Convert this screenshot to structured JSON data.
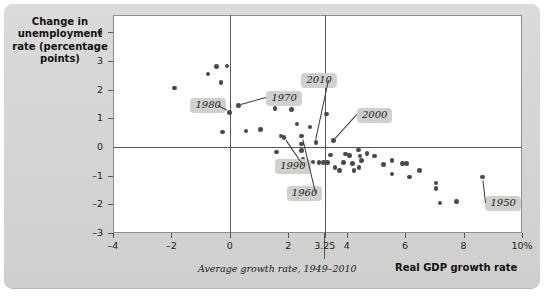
{
  "figure": {
    "y_axis_title": "Change in unemployment rate (percentage points)",
    "x_axis_title": "Real GDP growth rate",
    "annotation_note": "Average growth rate, 1949–2010"
  },
  "chart_data": {
    "type": "scatter",
    "title": "",
    "subtitle": "",
    "xlabel": "Real GDP growth rate",
    "ylabel": "Change in unemployment rate (percentage points)",
    "xlim": [
      -4,
      10
    ],
    "ylim": [
      -3,
      4.6
    ],
    "grid": false,
    "legend": "none",
    "x_ticks": [
      "-4",
      "-2",
      "0",
      "2",
      "3.25",
      "4",
      "6",
      "8",
      "10%"
    ],
    "x_tick_values": [
      -4,
      -2,
      0,
      2,
      3.25,
      4,
      6,
      8,
      10
    ],
    "y_ticks": [
      "4",
      "3",
      "2",
      "1",
      "0",
      "-1",
      "-2",
      "-3"
    ],
    "y_tick_values": [
      4,
      3,
      2,
      1,
      0,
      -1,
      -2,
      -3
    ],
    "reference_lines": [
      {
        "name": "zero-unemployment-change",
        "orientation": "horizontal",
        "value": 0
      },
      {
        "name": "zero-growth",
        "orientation": "vertical",
        "value": 0
      },
      {
        "name": "average-growth-rate",
        "orientation": "vertical",
        "value": 3.25,
        "label": "Average growth rate, 1949–2010"
      }
    ],
    "annotations": [
      {
        "label": "1980",
        "x": 0.0,
        "y": 1.25,
        "box_x": -1.35,
        "box_y": 1.45
      },
      {
        "label": "1970",
        "x": 0.3,
        "y": 1.45,
        "box_x": 1.25,
        "box_y": 1.72
      },
      {
        "label": "2010",
        "x": 2.95,
        "y": 0.16,
        "box_x": 2.45,
        "box_y": 2.33
      },
      {
        "label": "2000",
        "x": 3.55,
        "y": 0.22,
        "box_x": 4.35,
        "box_y": 1.12
      },
      {
        "label": "1990",
        "x": 1.85,
        "y": 0.3,
        "box_x": 1.55,
        "box_y": -0.68
      },
      {
        "label": "1960",
        "x": 2.45,
        "y": 0.35,
        "box_x": 1.95,
        "box_y": -1.62
      },
      {
        "label": "1950",
        "x": 8.65,
        "y": -1.05,
        "box_x": 8.75,
        "box_y": -1.95
      }
    ],
    "points": [
      {
        "x": -1.9,
        "y": 2.05
      },
      {
        "x": -0.75,
        "y": 2.55
      },
      {
        "x": -0.45,
        "y": 2.8
      },
      {
        "x": -0.3,
        "y": 2.25
      },
      {
        "x": -0.1,
        "y": 2.82
      },
      {
        "x": -0.02,
        "y": 1.2
      },
      {
        "x": -0.25,
        "y": 0.52
      },
      {
        "x": 0.3,
        "y": 1.45
      },
      {
        "x": 0.55,
        "y": 0.55
      },
      {
        "x": 1.05,
        "y": 0.6
      },
      {
        "x": 1.55,
        "y": 1.35
      },
      {
        "x": 1.75,
        "y": 0.38
      },
      {
        "x": 1.85,
        "y": 0.32
      },
      {
        "x": 1.6,
        "y": -0.18
      },
      {
        "x": 2.1,
        "y": 1.3
      },
      {
        "x": 2.3,
        "y": 0.8
      },
      {
        "x": 2.45,
        "y": 0.38
      },
      {
        "x": 2.45,
        "y": 0.1
      },
      {
        "x": 2.45,
        "y": -0.12
      },
      {
        "x": 2.5,
        "y": -0.42
      },
      {
        "x": 2.75,
        "y": 0.7
      },
      {
        "x": 2.95,
        "y": 0.16
      },
      {
        "x": 2.6,
        "y": -0.52
      },
      {
        "x": 2.85,
        "y": -0.52
      },
      {
        "x": 3.05,
        "y": -0.55
      },
      {
        "x": 3.2,
        "y": -0.55
      },
      {
        "x": 3.35,
        "y": -0.55
      },
      {
        "x": 3.3,
        "y": 1.15
      },
      {
        "x": 3.55,
        "y": 0.22
      },
      {
        "x": 3.45,
        "y": -0.28
      },
      {
        "x": 3.6,
        "y": -0.72
      },
      {
        "x": 3.75,
        "y": -0.82
      },
      {
        "x": 3.9,
        "y": -0.55
      },
      {
        "x": 3.95,
        "y": -0.25
      },
      {
        "x": 4.1,
        "y": -0.3
      },
      {
        "x": 4.2,
        "y": -0.58
      },
      {
        "x": 4.25,
        "y": -0.82
      },
      {
        "x": 4.4,
        "y": -0.1
      },
      {
        "x": 4.45,
        "y": -0.32
      },
      {
        "x": 4.5,
        "y": -0.48
      },
      {
        "x": 4.42,
        "y": -0.72
      },
      {
        "x": 4.7,
        "y": -0.22
      },
      {
        "x": 4.95,
        "y": -0.32
      },
      {
        "x": 5.25,
        "y": -0.62
      },
      {
        "x": 5.55,
        "y": -0.48
      },
      {
        "x": 5.55,
        "y": -0.95
      },
      {
        "x": 5.9,
        "y": -0.58
      },
      {
        "x": 6.05,
        "y": -0.58
      },
      {
        "x": 6.15,
        "y": -1.05
      },
      {
        "x": 6.5,
        "y": -0.82
      },
      {
        "x": 7.05,
        "y": -1.25
      },
      {
        "x": 7.05,
        "y": -1.45
      },
      {
        "x": 7.2,
        "y": -1.95
      },
      {
        "x": 7.75,
        "y": -1.9
      },
      {
        "x": 8.65,
        "y": -1.05
      }
    ]
  }
}
